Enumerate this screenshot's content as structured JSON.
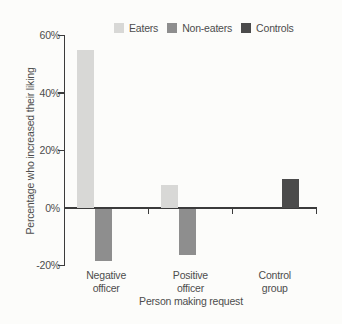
{
  "figure": {
    "background": "#fcfcfa",
    "text_color": "#4d4d4d",
    "axis_color": "#3b3b3b"
  },
  "chart_data": {
    "type": "bar",
    "title": "",
    "xlabel": "Person making request",
    "ylabel": "Percentage who increased their liking",
    "categories": [
      "Negative officer",
      "Positive officer",
      "Control group"
    ],
    "category_label_lines": [
      [
        "Negative",
        "officer"
      ],
      [
        "Positive",
        "officer"
      ],
      [
        "Control",
        "group"
      ]
    ],
    "series": [
      {
        "name": "Eaters",
        "color": "#d8d8d6",
        "values": [
          55,
          8,
          null
        ]
      },
      {
        "name": "Non-eaters",
        "color": "#8e8e8e",
        "values": [
          -18,
          -16,
          null
        ]
      },
      {
        "name": "Controls",
        "color": "#4b4b4b",
        "values": [
          null,
          null,
          10
        ]
      }
    ],
    "y_ticks": [
      {
        "value": 60,
        "label": "60%"
      },
      {
        "value": 40,
        "label": "40%"
      },
      {
        "value": 20,
        "label": "20%"
      },
      {
        "value": 0,
        "label": "0%"
      },
      {
        "value": -20,
        "label": "-20%"
      }
    ],
    "ylim": [
      -20,
      60
    ],
    "grid": false,
    "legend_position": "top"
  }
}
